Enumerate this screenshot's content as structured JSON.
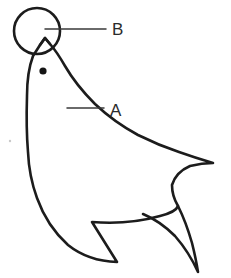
{
  "figure": {
    "background_color": "#ffffff",
    "ink_color": "#1c1c1c",
    "leader_color": "#3a3a3a",
    "canvas": {
      "width": 231,
      "height": 278
    }
  },
  "labels": [
    {
      "id": "B",
      "text": "B",
      "refers_to": "ball",
      "x": 112,
      "y": 35,
      "leader": {
        "x1": 45,
        "y1": 29,
        "x2": 106,
        "y2": 29
      }
    },
    {
      "id": "A",
      "text": "A",
      "refers_to": "body",
      "x": 110,
      "y": 116,
      "leader": {
        "x1": 67,
        "y1": 108,
        "x2": 104,
        "y2": 108
      }
    }
  ],
  "parts": {
    "ball_label": "B",
    "body_label": "A",
    "eye_label": "eye",
    "tail_label": "tail fluke",
    "flipper_label": "flipper"
  },
  "geometry": {
    "ball": {
      "cx": 37,
      "cy": 31,
      "r": 23
    },
    "eye": {
      "cx": 43,
      "cy": 71,
      "r": 3.6
    },
    "body_outline": "M 40 45 L 33 56 Q 27 72 27 96 Q 26 128 28 152 Q 29 176 37 198 Q 47 226 68 245 Q 88 261 117 262 L 92 222 Q 128 225 160 216 Q 176 212 178 206 Q 172 196 172 185 Q 176 172 190 166 Q 202 163 213 163 Q 196 158 179 152 Q 158 145 138 135 Q 114 122 95 104 Q 76 85 65 66 Q 57 52 50 44 L 45 38 Z",
    "snout": "M 40 45 L 45 38 L 50 44",
    "tail_lower": "M 178 206 Q 186 222 192 243 Q 196 259 198 272 Q 189 252 175 236 Q 160 221 143 214",
    "tail_upper_tip": {
      "x": 213,
      "y": 163
    },
    "tail_lower_tip": {
      "x": 198,
      "y": 272
    },
    "tail_notch": {
      "x": 178,
      "y": 206
    },
    "flipper_tip": {
      "x": 118,
      "y": 262
    },
    "flipper_root": {
      "x": 92,
      "y": 222
    },
    "speck": {
      "cx": 10,
      "cy": 141,
      "r": 1.2
    }
  }
}
